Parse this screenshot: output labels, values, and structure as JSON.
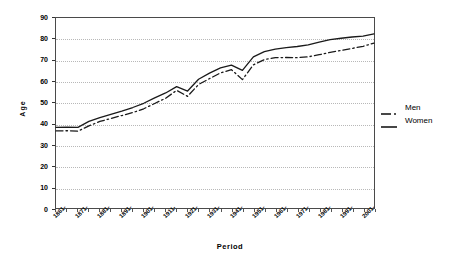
{
  "chart_data": {
    "type": "line",
    "title": "",
    "xlabel": "Period",
    "ylabel": "Age",
    "ylim": [
      0,
      90
    ],
    "ytick_labels": [
      "90",
      "80",
      "70",
      "60",
      "50",
      "40",
      "30",
      "20",
      "10",
      "0"
    ],
    "ytick_values": [
      90,
      80,
      70,
      60,
      50,
      40,
      30,
      20,
      10,
      0
    ],
    "grid": true,
    "legend_position": "right",
    "categories": [
      "1861-",
      "1866-",
      "1871-",
      "1876-",
      "1881-",
      "1886-",
      "1891-",
      "1896-",
      "1901-",
      "1906-",
      "1911-",
      "1916-",
      "1921-",
      "1926-",
      "1931-",
      "1936-",
      "1941-",
      "1946-",
      "1951-",
      "1956-",
      "1961-",
      "1966-",
      "1971-",
      "1976-",
      "1981-",
      "1986-",
      "1991-",
      "1996-",
      "2001-",
      "2006-"
    ],
    "xtick_labels": [
      "1861-",
      "1871-",
      "1881-",
      "1891-",
      "1901-",
      "1911-",
      "1921-",
      "1931-",
      "1941-",
      "1951-",
      "1961-",
      "1971-",
      "1981-",
      "1991-",
      "2001-"
    ],
    "series": [
      {
        "name": "Men",
        "style": "dash-dot",
        "values": [
          36.5,
          36.6,
          36.4,
          38.9,
          41.0,
          42.4,
          43.8,
          45.2,
          47.0,
          49.5,
          52.0,
          55.7,
          52.9,
          58.5,
          61.3,
          64.0,
          65.5,
          60.8,
          67.8,
          70.3,
          71.2,
          71.3,
          71.2,
          71.6,
          72.6,
          73.7,
          74.6,
          75.6,
          76.6,
          78.1
        ]
      },
      {
        "name": "Women",
        "style": "solid",
        "values": [
          38.2,
          38.3,
          38.2,
          41.0,
          42.8,
          44.4,
          45.9,
          47.6,
          49.6,
          52.2,
          54.5,
          57.5,
          55.4,
          61.0,
          63.9,
          66.4,
          67.7,
          65.2,
          71.6,
          74.1,
          75.3,
          76.0,
          76.5,
          77.3,
          78.6,
          79.8,
          80.4,
          81.0,
          81.4,
          82.5
        ]
      }
    ]
  },
  "legend": {
    "items": [
      {
        "label": "Men"
      },
      {
        "label": "Women"
      }
    ]
  },
  "colors": {
    "series_line": "#1a1a1a",
    "axis": "#4a4a4a",
    "grid": "#b8b8b8",
    "background": "#ffffff"
  }
}
